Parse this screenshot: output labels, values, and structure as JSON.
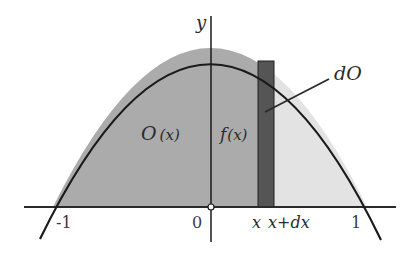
{
  "diagram": {
    "type": "area-under-curve",
    "axes": {
      "y_label": "y",
      "x_ticks": [
        {
          "label": "-1",
          "value": -1
        },
        {
          "label": "0",
          "value": 0
        },
        {
          "label": "1",
          "value": 1
        }
      ]
    },
    "labels": {
      "area_left": "O",
      "area_left_arg": "(x)",
      "curve": "f",
      "curve_arg": "(x)",
      "strip": "dO",
      "x": "x",
      "x_plus_dx": "x+dx"
    },
    "colors": {
      "area_left": "#ababab",
      "area_right": "#e3e3e3",
      "strip": "#555555",
      "curve": "#1a1a1a",
      "axis": "#2a2a2a"
    }
  }
}
